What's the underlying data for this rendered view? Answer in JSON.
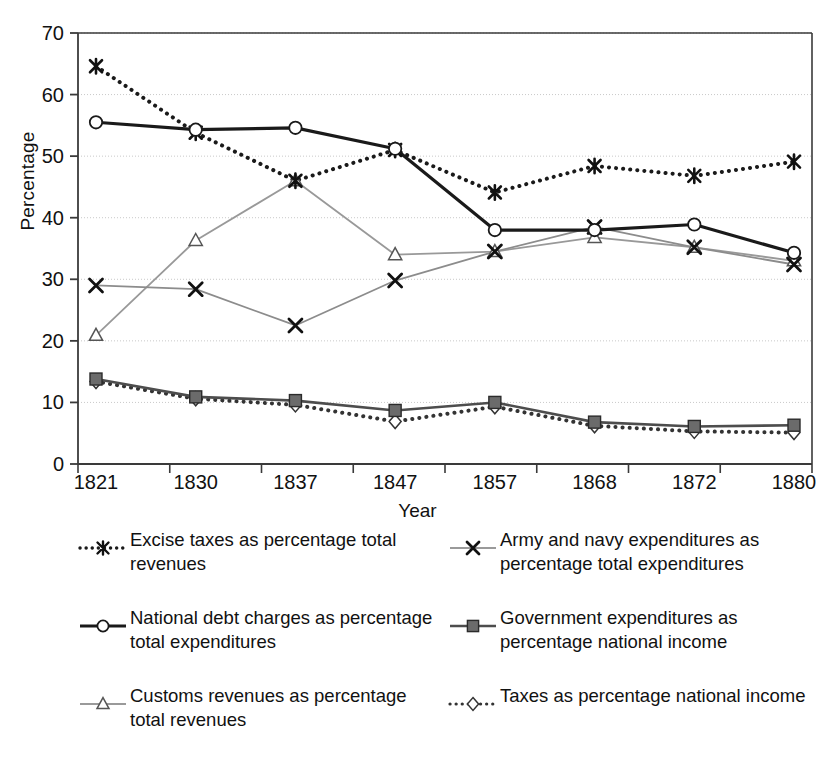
{
  "chart_data": {
    "type": "line",
    "title": "",
    "xlabel": "Year",
    "ylabel": "Percentage",
    "categories": [
      "1821",
      "1830",
      "1837",
      "1847",
      "1857",
      "1868",
      "1872",
      "1880"
    ],
    "x": [
      1821,
      1830,
      1837,
      1847,
      1857,
      1868,
      1872,
      1880
    ],
    "ylim": [
      0,
      70
    ],
    "yticks": [
      "0",
      "10",
      "20",
      "30",
      "40",
      "50",
      "60",
      "70"
    ],
    "ytick_values": [
      0,
      10,
      20,
      30,
      40,
      50,
      60,
      70
    ],
    "grid": true,
    "legend_position": "below-two-columns",
    "series": [
      {
        "name": "Excise taxes as percentage total revenues",
        "marker": "asterisk",
        "line": "dotted",
        "color": "#1a1a1a",
        "values": [
          64.6,
          53.8,
          46.0,
          51.0,
          44.1,
          48.4,
          46.8,
          49.1
        ]
      },
      {
        "name": "Army and navy expenditures as percentage total expenditures",
        "marker": "x",
        "line": "solid-light",
        "color": "#8c8c8c",
        "values": [
          29.0,
          28.4,
          22.5,
          29.8,
          34.5,
          38.5,
          35.2,
          32.4
        ]
      },
      {
        "name": "National debt charges as percentage total expenditures",
        "marker": "circle",
        "line": "solid-bold",
        "color": "#1a1a1a",
        "values": [
          55.5,
          54.3,
          54.6,
          51.2,
          38.0,
          38.0,
          38.9,
          34.3
        ]
      },
      {
        "name": "Government expenditures as percentage national income",
        "marker": "square",
        "line": "solid",
        "color": "#4d4d4d",
        "values": [
          13.8,
          10.9,
          10.3,
          8.7,
          10.0,
          6.8,
          6.1,
          6.3
        ]
      },
      {
        "name": "Customs revenues as percentage total revenues",
        "marker": "triangle",
        "line": "solid-light",
        "color": "#999999",
        "values": [
          20.9,
          36.3,
          46.0,
          34.0,
          34.5,
          36.8,
          35.2,
          33.0
        ]
      },
      {
        "name": "Taxes as percentage national income",
        "marker": "diamond",
        "line": "dotted",
        "color": "#333333",
        "values": [
          13.4,
          10.6,
          9.6,
          6.9,
          9.3,
          6.2,
          5.3,
          5.1
        ]
      }
    ]
  },
  "axes": {
    "ylabel": "Percentage",
    "xlabel": "Year"
  },
  "legend": {
    "left": [
      {
        "symbol": "asterisk-dotted-icon",
        "label": "Excise taxes as percentage total revenues"
      },
      {
        "symbol": "circle-solid-icon",
        "label": "National debt charges as percentage total expenditures"
      },
      {
        "symbol": "triangle-line-icon",
        "label": "Customs revenues as percentage total revenues"
      }
    ],
    "right": [
      {
        "symbol": "x-line-icon",
        "label": "Army and navy expenditures as percentage total expenditures"
      },
      {
        "symbol": "square-solid-icon",
        "label": "Government expenditures as percentage national income"
      },
      {
        "symbol": "diamond-dotted-icon",
        "label": "Taxes as percentage national income"
      }
    ]
  }
}
